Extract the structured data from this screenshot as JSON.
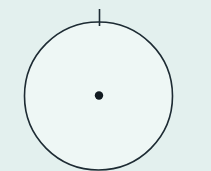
{
  "figure": {
    "type": "geometric-diagram",
    "width": 211,
    "height": 171,
    "background_color": "#e3f0ee",
    "interior_color": "#eef7f5",
    "stroke_color": "#1d2b33",
    "shapes": {
      "circle": {
        "name": "main-circle",
        "center_x": 98.5,
        "center_y": 96,
        "radius": 74,
        "stroke_width": 1.6,
        "fill": "#eef7f5"
      },
      "center_dot": {
        "name": "centre-point",
        "center_x": 99,
        "center_y": 95.5,
        "radius": 4.2,
        "fill": "#111a20"
      },
      "tick_mark": {
        "name": "top-tick",
        "x": 99.5,
        "y_start": 9,
        "y_end": 26,
        "stroke_width": 1.6,
        "angle_deg": 90,
        "position_label": "top"
      }
    }
  }
}
